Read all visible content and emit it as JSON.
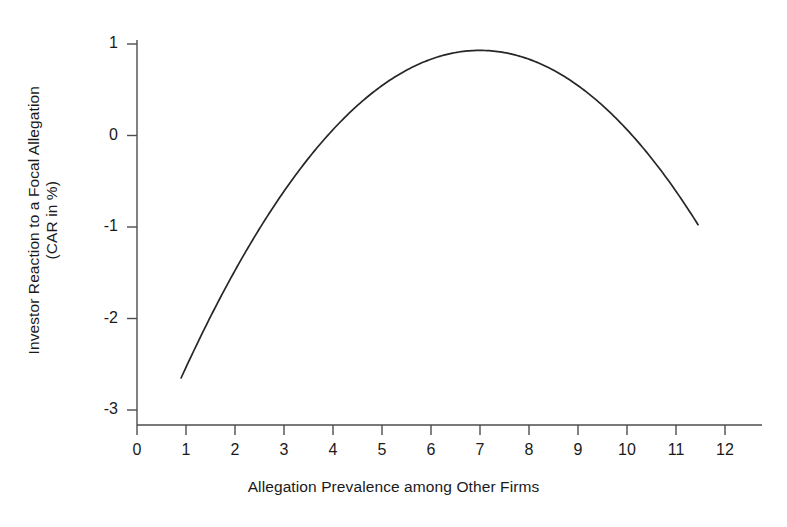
{
  "chart_data": {
    "type": "line",
    "title": "",
    "subtitle": "",
    "xlabel": "Allegation Prevalence among Other Firms",
    "ylabel": "Investor Reaction to a Focal Allegation",
    "ylabel_line2": "(CAR in %)",
    "ylabel_lines": [
      "Investor Reaction to a Focal Allegation",
      "(CAR in %)"
    ],
    "xlim": [
      0,
      12.5
    ],
    "ylim": [
      -3.3,
      1.25
    ],
    "xticks": [
      0,
      1,
      2,
      3,
      4,
      5,
      6,
      7,
      8,
      9,
      10,
      11,
      12
    ],
    "xtick_labels": [
      "0",
      "1",
      "2",
      "3",
      "4",
      "5",
      "6",
      "7",
      "8",
      "9",
      "10",
      "11",
      "12"
    ],
    "yticks": [
      1,
      0,
      -1,
      -2,
      -3
    ],
    "ytick_labels": [
      "1",
      "0",
      "-1",
      "-2",
      "-3"
    ],
    "grid": false,
    "legend": false,
    "legend_position": "none",
    "curve_color": "#262626",
    "curve_width": 1.6,
    "axis_color": "#4d4d4d",
    "background": "#ffffff",
    "annotations": [],
    "series": [
      {
        "name": "Predicted CAR (inverted U)",
        "form": "quadratic",
        "equation": "y = -0.0963*(x - 7.0)^2 + 0.93",
        "vertex": [
          7.0,
          0.93
        ],
        "x_range": [
          0.9,
          11.45
        ],
        "x": [
          0.9,
          1.4,
          1.9,
          2.4,
          2.9,
          3.4,
          3.9,
          4.4,
          4.9,
          5.4,
          5.9,
          6.4,
          6.9,
          7.4,
          7.9,
          8.4,
          8.9,
          9.4,
          9.9,
          10.4,
          10.9,
          11.45
        ],
        "values": [
          -2.65,
          -2.27,
          -1.93,
          -1.62,
          -1.35,
          -1.12,
          -0.93,
          -0.77,
          -0.65,
          -0.57,
          -0.53,
          -0.52,
          -0.55,
          -0.62,
          -0.72,
          -0.86,
          -1.04,
          -1.25,
          -1.51,
          -1.79,
          -2.12,
          -2.5
        ]
      }
    ],
    "series_plotted_values": {
      "note": "CAR in % plotted on y-axis; inverted-U shape peaking near prevalence 7",
      "y_at_x": {
        "0.9": -2.65,
        "2.0": -1.88,
        "3.0": -1.61,
        "4.0": -0.94,
        "5.0": -0.55,
        "6.0": 0.62,
        "7.0": 0.93,
        "8.0": 0.83,
        "9.0": 0.55,
        "10.0": 0.06,
        "11.0": -0.61,
        "11.45": -0.75
      }
    }
  }
}
